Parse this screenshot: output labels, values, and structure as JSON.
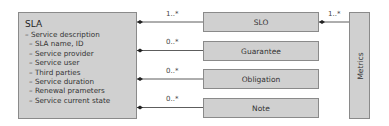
{
  "sla": {
    "title": "SLA",
    "items": [
      {
        "text": "– Service description",
        "level": 0
      },
      {
        "text": "– SLA name, ID",
        "level": 1
      },
      {
        "text": "– Service provider",
        "level": 1
      },
      {
        "text": "– Service user",
        "level": 1
      },
      {
        "text": "– Third parties",
        "level": 1
      },
      {
        "text": "– Service duration",
        "level": 1
      },
      {
        "text": "– Renewal prameters",
        "level": 1
      },
      {
        "text": "– Service current state",
        "level": 1
      }
    ]
  },
  "components": [
    {
      "label": "SLO",
      "multiplicity": "1..*"
    },
    {
      "label": "Guarantee",
      "multiplicity": "0..*"
    },
    {
      "label": "Obligation",
      "multiplicity": "0..*"
    },
    {
      "label": "Note",
      "multiplicity": "0..*"
    }
  ],
  "metrics": {
    "label": "Metrics",
    "multiplicity": "1..*"
  }
}
